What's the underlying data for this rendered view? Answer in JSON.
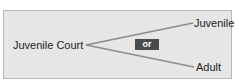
{
  "diagram": {
    "source": {
      "label": "Juvenile Court"
    },
    "targets": [
      {
        "label": "Juvenile"
      },
      {
        "label": "Adult"
      }
    ],
    "connector_label": "or"
  },
  "colors": {
    "panel_bg": "#e6e6e6",
    "panel_border": "#b8b8b8",
    "line": "#8c8c8c",
    "badge_bg": "#4a4a4a",
    "badge_text": "#ffffff",
    "text": "#222222"
  }
}
